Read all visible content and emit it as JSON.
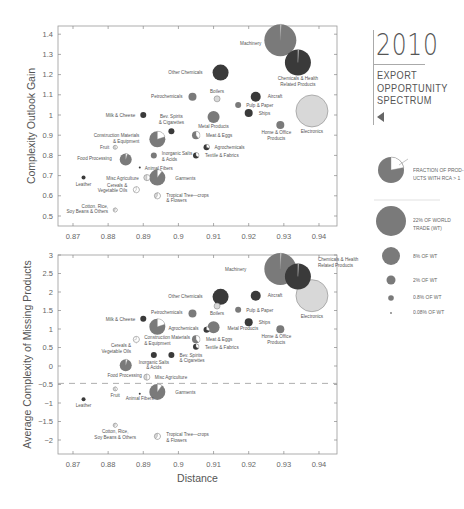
{
  "title": {
    "year": "2010",
    "subtitle_lines": [
      "EXPORT",
      "OPPORTUNITY",
      "SPECTRUM"
    ]
  },
  "legend": {
    "fraction_label_lines": [
      "FRACTION OF PROD-",
      "UCTS WITH RCA > 1"
    ],
    "size_items": [
      {
        "label_lines": [
          "22% OF WORLD",
          "TRADE (WT)"
        ],
        "radius": 15
      },
      {
        "label_lines": [
          "8% OF WT"
        ],
        "radius": 9
      },
      {
        "label_lines": [
          "2% OF WT"
        ],
        "radius": 4.5
      },
      {
        "label_lines": [
          "0.8% OF WT"
        ],
        "radius": 2.8
      },
      {
        "label_lines": [
          "0.08% OF WT"
        ],
        "radius": 0.9
      }
    ]
  },
  "colors": {
    "mid_gray": "#7a7a7a",
    "dark_gray": "#3a3a3a",
    "light_gray": "#d8d8d8",
    "axis": "#888888"
  },
  "chart_data": [
    {
      "type": "scatter",
      "subtype": "bubble",
      "title": "",
      "xlabel": "",
      "ylabel": "Complexity Outlook Gain",
      "xlim": [
        0.866,
        0.945
      ],
      "ylim": [
        0.45,
        1.45
      ],
      "xticks": [
        "0.87",
        "0.88",
        "0.89",
        "0.9",
        "0.91",
        "0.92",
        "0.93",
        "0.94"
      ],
      "yticks": [
        "0.5",
        "0.6",
        "0.7",
        "0.8",
        "0.9",
        "1",
        "1.1",
        "1.2",
        "1.3",
        "1.4"
      ],
      "grid": false,
      "points": [
        {
          "name": "Machinery",
          "x": 0.929,
          "y": 1.37,
          "r": 16,
          "fill": "mid",
          "rca": 0.01,
          "lx": -3,
          "ly": 5,
          "anchor": "end"
        },
        {
          "name": "Chemicals & Health Related Products",
          "x": 0.934,
          "y": 1.26,
          "r": 13,
          "fill": "dark",
          "rca": 0.01,
          "lx": 0,
          "ly": 18,
          "anchor": "middle",
          "lines": [
            "Chemicals & Health",
            "Related Products"
          ]
        },
        {
          "name": "Other Chemicals",
          "x": 0.912,
          "y": 1.21,
          "r": 8,
          "fill": "dark",
          "rca": 0,
          "lx": -10,
          "ly": 1,
          "anchor": "end"
        },
        {
          "name": "Electronics",
          "x": 0.938,
          "y": 1.02,
          "r": 16,
          "fill": "light",
          "rca": 0,
          "lx": 0,
          "ly": 22,
          "anchor": "middle"
        },
        {
          "name": "Petrochemicals",
          "x": 0.904,
          "y": 1.09,
          "r": 4,
          "fill": "mid",
          "rca": 0,
          "lx": -6,
          "ly": 1,
          "anchor": "end"
        },
        {
          "name": "Boilers",
          "x": 0.911,
          "y": 1.08,
          "r": 3,
          "fill": "light",
          "rca": 0,
          "lx": 0,
          "ly": -6,
          "anchor": "middle"
        },
        {
          "name": "Aircraft",
          "x": 0.922,
          "y": 1.09,
          "r": 5,
          "fill": "dark",
          "rca": 0,
          "lx": 7,
          "ly": 1,
          "anchor": "start"
        },
        {
          "name": "Pulp & Paper",
          "x": 0.917,
          "y": 1.05,
          "r": 3,
          "fill": "mid",
          "rca": 0,
          "lx": 5,
          "ly": 2,
          "anchor": "start"
        },
        {
          "name": "Ships",
          "x": 0.92,
          "y": 1.01,
          "r": 4,
          "fill": "dark",
          "rca": 0,
          "lx": 6,
          "ly": 2,
          "anchor": "start"
        },
        {
          "name": "Metal Products",
          "x": 0.91,
          "y": 0.99,
          "r": 6,
          "fill": "mid",
          "rca": 0,
          "lx": 0,
          "ly": 11,
          "anchor": "middle"
        },
        {
          "name": "Home & Office Products",
          "x": 0.929,
          "y": 0.95,
          "r": 4,
          "fill": "mid",
          "rca": 0,
          "lx": -4,
          "ly": 9,
          "anchor": "middle",
          "lines": [
            "Home & Office",
            "Products"
          ]
        },
        {
          "name": "Milk & Cheese",
          "x": 0.89,
          "y": 1.0,
          "r": 3,
          "fill": "dark",
          "rca": 0,
          "lx": -5,
          "ly": 2,
          "anchor": "end"
        },
        {
          "name": "Bev. Spirits & Cigarettes",
          "x": 0.898,
          "y": 0.92,
          "r": 3,
          "fill": "dark",
          "rca": 0,
          "lx": 0,
          "ly": -13,
          "anchor": "middle",
          "lines": [
            "Bev. Spirits",
            "& Cigarettes"
          ]
        },
        {
          "name": "Construction Materials & Equipment",
          "x": 0.894,
          "y": 0.88,
          "r": 8,
          "fill": "mid",
          "rca": 0.2,
          "lx": -10,
          "ly": -2,
          "anchor": "end",
          "lines": [
            "Construction Materials",
            "& Equipment"
          ]
        },
        {
          "name": "Meat & Eggs",
          "x": 0.905,
          "y": 0.9,
          "r": 4,
          "fill": "mid",
          "rca": 0.4,
          "lx": 6,
          "ly": 2,
          "anchor": "start"
        },
        {
          "name": "Agrochemicals",
          "x": 0.908,
          "y": 0.84,
          "r": 3,
          "fill": "dark",
          "rca": 0.3,
          "lx": 5,
          "ly": 2,
          "anchor": "start"
        },
        {
          "name": "Inorganic Salts & Acids",
          "x": 0.893,
          "y": 0.8,
          "r": 3,
          "fill": "mid",
          "rca": 0,
          "lx": 5,
          "ly": 0,
          "anchor": "start",
          "lines": [
            "Inorganic Salts",
            "& Acids"
          ]
        },
        {
          "name": "Textile & Fabrics",
          "x": 0.905,
          "y": 0.8,
          "r": 3,
          "fill": "dark",
          "rca": 0.35,
          "lx": 6,
          "ly": 2,
          "anchor": "start"
        },
        {
          "name": "Fruit",
          "x": 0.882,
          "y": 0.84,
          "r": 2,
          "fill": "light",
          "rca": 0.4,
          "lx": -4,
          "ly": 2,
          "anchor": "end"
        },
        {
          "name": "Food Processing",
          "x": 0.885,
          "y": 0.78,
          "r": 6,
          "fill": "mid",
          "rca": 0.05,
          "lx": -8,
          "ly": 1,
          "anchor": "end"
        },
        {
          "name": "Animal Fibers",
          "x": 0.889,
          "y": 0.74,
          "r": 1,
          "fill": "dark",
          "rca": 0,
          "lx": 4,
          "ly": 2,
          "anchor": "start"
        },
        {
          "name": "Leather",
          "x": 0.873,
          "y": 0.69,
          "r": 2,
          "fill": "dark",
          "rca": 0,
          "lx": 0,
          "ly": 8,
          "anchor": "middle"
        },
        {
          "name": "Misc Agriculture",
          "x": 0.891,
          "y": 0.69,
          "r": 3,
          "fill": "light",
          "rca": 0.5,
          "lx": -5,
          "ly": 2,
          "anchor": "end"
        },
        {
          "name": "Garments",
          "x": 0.894,
          "y": 0.69,
          "r": 8,
          "fill": "mid",
          "rca": 0.1,
          "lx": 10,
          "ly": 2,
          "anchor": "start"
        },
        {
          "name": "Cereals & Vegetable Oils",
          "x": 0.888,
          "y": 0.63,
          "r": 3,
          "fill": "white",
          "rca": 0.6,
          "lx": -6,
          "ly": -3,
          "anchor": "end",
          "lines": [
            "Cereals &",
            "Vegetable Oils"
          ]
        },
        {
          "name": "Tropical Tree-crops & Flowers",
          "x": 0.894,
          "y": 0.6,
          "r": 3,
          "fill": "light",
          "rca": 0.6,
          "lx": 6,
          "ly": 1,
          "anchor": "start",
          "lines": [
            "Tropical Tree—crops",
            "& Flowers"
          ]
        },
        {
          "name": "Cotton, Rice, Soy Beans & Others",
          "x": 0.882,
          "y": 0.53,
          "r": 2,
          "fill": "light",
          "rca": 0.6,
          "lx": -5,
          "ly": -2,
          "anchor": "end",
          "lines": [
            "Cotton, Rice,",
            "Soy Beans & Others"
          ]
        }
      ]
    },
    {
      "type": "scatter",
      "subtype": "bubble",
      "title": "",
      "xlabel": "Distance",
      "ylabel": "Average Complexity of Missing Products",
      "xlim": [
        0.866,
        0.945
      ],
      "ylim": [
        -2.4,
        3.0
      ],
      "xticks": [
        "0.87",
        "0.88",
        "0.89",
        "0.9",
        "0.91",
        "0.92",
        "0.93",
        "0.94"
      ],
      "yticks": [
        "3",
        "2.5",
        "2",
        "1.5",
        "1",
        "0.5",
        "0",
        "−0.5",
        "−1",
        "−1.5",
        "−2"
      ],
      "grid": false,
      "reference_line": {
        "y": -0.47,
        "style": "dashed"
      },
      "points": [
        {
          "name": "Machinery",
          "x": 0.929,
          "y": 2.62,
          "r": 16,
          "fill": "mid",
          "rca": 0.01,
          "lx": -18,
          "ly": 2,
          "anchor": "end"
        },
        {
          "name": "Chemicals & Health Related Products",
          "x": 0.934,
          "y": 2.42,
          "r": 13,
          "fill": "dark",
          "rca": 0.01,
          "lx": 7,
          "ly": -15,
          "anchor": "start",
          "lines": [
            "Chemicals & Health",
            "Related Products"
          ]
        },
        {
          "name": "Electronics",
          "x": 0.938,
          "y": 1.9,
          "r": 16,
          "fill": "light",
          "rca": 0,
          "lx": 0,
          "ly": 22,
          "anchor": "middle"
        },
        {
          "name": "Other Chemicals",
          "x": 0.912,
          "y": 1.87,
          "r": 8,
          "fill": "dark",
          "rca": 0,
          "lx": -10,
          "ly": 1,
          "anchor": "end"
        },
        {
          "name": "Aircraft",
          "x": 0.922,
          "y": 1.9,
          "r": 5,
          "fill": "dark",
          "rca": 0,
          "lx": 7,
          "ly": 1,
          "anchor": "start"
        },
        {
          "name": "Boilers",
          "x": 0.911,
          "y": 1.62,
          "r": 3,
          "fill": "light",
          "rca": 0,
          "lx": 0,
          "ly": 9,
          "anchor": "middle"
        },
        {
          "name": "Petrochemicals",
          "x": 0.904,
          "y": 1.42,
          "r": 4,
          "fill": "mid",
          "rca": 0,
          "lx": -6,
          "ly": 1,
          "anchor": "end"
        },
        {
          "name": "Pulp & Paper",
          "x": 0.917,
          "y": 1.52,
          "r": 3,
          "fill": "mid",
          "rca": 0,
          "lx": 5,
          "ly": 2,
          "anchor": "start"
        },
        {
          "name": "Ships",
          "x": 0.92,
          "y": 1.18,
          "r": 4,
          "fill": "dark",
          "rca": 0,
          "lx": 6,
          "ly": 2,
          "anchor": "start"
        },
        {
          "name": "Metal Products",
          "x": 0.91,
          "y": 1.05,
          "r": 6,
          "fill": "mid",
          "rca": 0,
          "lx": 8,
          "ly": 3,
          "anchor": "start"
        },
        {
          "name": "Agrochemicals",
          "x": 0.908,
          "y": 0.98,
          "r": 3,
          "fill": "dark",
          "rca": 0.3,
          "lx": -5,
          "ly": 0,
          "anchor": "end"
        },
        {
          "name": "Home & Office Products",
          "x": 0.929,
          "y": 0.99,
          "r": 4,
          "fill": "mid",
          "rca": 0,
          "lx": -4,
          "ly": 9,
          "anchor": "middle",
          "lines": [
            "Home & Office",
            "Products"
          ]
        },
        {
          "name": "Milk & Cheese",
          "x": 0.89,
          "y": 1.28,
          "r": 3,
          "fill": "dark",
          "rca": 0,
          "lx": -5,
          "ly": 2,
          "anchor": "end"
        },
        {
          "name": "Construction Materials & Equipment",
          "x": 0.894,
          "y": 1.06,
          "r": 8,
          "fill": "mid",
          "rca": 0.2,
          "lx": 0,
          "ly": 0,
          "anchor": "start",
          "nolabel": true
        },
        {
          "name": "Construction Materials & Equipment (label)",
          "x": 0.888,
          "y": 0.72,
          "r": 3,
          "fill": "white",
          "rca": 0.7,
          "lx": 5,
          "ly": 0,
          "anchor": "start",
          "lines": [
            "Construction Materials",
            "& Equipment"
          ]
        },
        {
          "name": "Meat & Eggs",
          "x": 0.905,
          "y": 0.72,
          "r": 4,
          "fill": "mid",
          "rca": 0.4,
          "lx": 6,
          "ly": 2,
          "anchor": "start"
        },
        {
          "name": "Textile & Fabrics",
          "x": 0.905,
          "y": 0.52,
          "r": 3,
          "fill": "dark",
          "rca": 0.35,
          "lx": 6,
          "ly": 2,
          "anchor": "start"
        },
        {
          "name": "Cereals & Vegetable Oils",
          "x": 0.888,
          "y": 0.62,
          "r": 0.1,
          "fill": "white",
          "rca": 0,
          "lx": -5,
          "ly": 4,
          "anchor": "end",
          "lines": [
            "Cereals &",
            "Vegetable Oils"
          ]
        },
        {
          "name": "Inorganic Salts & Acids",
          "x": 0.893,
          "y": 0.3,
          "r": 3,
          "fill": "dark",
          "rca": 0,
          "lx": 0,
          "ly": 9,
          "anchor": "middle",
          "lines": [
            "Inorganic Salts",
            "& Acids"
          ]
        },
        {
          "name": "Bev. Spirits & Cigarettes",
          "x": 0.898,
          "y": 0.3,
          "r": 3,
          "fill": "dark",
          "rca": 0,
          "lx": 5,
          "ly": 2,
          "anchor": "start",
          "lines": [
            "Bev. Spirits",
            "& Cigarettes"
          ]
        },
        {
          "name": "Food Processing",
          "x": 0.885,
          "y": 0.02,
          "r": 6,
          "fill": "mid",
          "rca": 0.05,
          "lx": -1,
          "ly": 12,
          "anchor": "middle"
        },
        {
          "name": "Misc Agriculture",
          "x": 0.891,
          "y": -0.3,
          "r": 3,
          "fill": "light",
          "rca": 0.5,
          "lx": 5,
          "ly": 2,
          "anchor": "start"
        },
        {
          "name": "Garments",
          "x": 0.894,
          "y": -0.7,
          "r": 8,
          "fill": "mid",
          "rca": 0.1,
          "lx": 10,
          "ly": 2,
          "anchor": "start"
        },
        {
          "name": "Fruit",
          "x": 0.882,
          "y": -0.62,
          "r": 2,
          "fill": "light",
          "rca": 0.4,
          "lx": 0,
          "ly": 8,
          "anchor": "middle"
        },
        {
          "name": "Animal Fibers",
          "x": 0.889,
          "y": -0.75,
          "r": 1,
          "fill": "dark",
          "rca": 0,
          "lx": 0,
          "ly": 6,
          "anchor": "middle"
        },
        {
          "name": "Leather",
          "x": 0.873,
          "y": -0.9,
          "r": 2,
          "fill": "dark",
          "rca": 0,
          "lx": 0,
          "ly": 8,
          "anchor": "middle"
        },
        {
          "name": "Cotton, Rice, Soy Beans & Others",
          "x": 0.882,
          "y": -1.6,
          "r": 2,
          "fill": "light",
          "rca": 0.6,
          "lx": 0,
          "ly": 8,
          "anchor": "middle",
          "lines": [
            "Cotton, Rice,",
            "Soy Beans & Others"
          ]
        },
        {
          "name": "Tropical Tree-crops & Flowers",
          "x": 0.894,
          "y": -1.9,
          "r": 3,
          "fill": "light",
          "rca": 0.6,
          "lx": 6,
          "ly": 0,
          "anchor": "start",
          "lines": [
            "Tropical Tree—crops",
            "& Flowers"
          ]
        }
      ]
    }
  ]
}
